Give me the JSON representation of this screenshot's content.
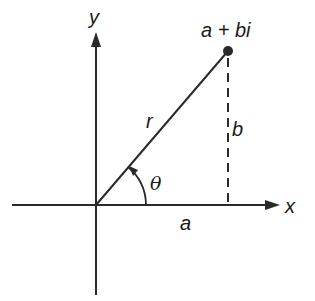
{
  "diagram": {
    "labels": {
      "y_axis": "y",
      "x_axis": "x",
      "point": "a + bi",
      "radius": "r",
      "imag_part": "b",
      "real_part": "a",
      "angle": "θ"
    },
    "colors": {
      "stroke": "#2a2a2a",
      "background": "#ffffff"
    }
  }
}
